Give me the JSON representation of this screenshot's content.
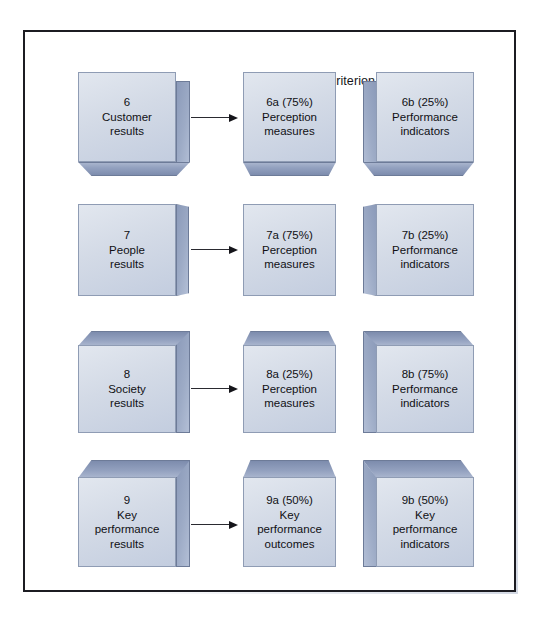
{
  "diagram": {
    "headers": {
      "left": "Criterion",
      "right": "Criterion parts"
    },
    "rows": [
      {
        "criterion": {
          "number": "6",
          "label": "6\nCustomer\nresults"
        },
        "parts": [
          {
            "code": "6a",
            "weight": "75%",
            "label": "6a (75%)\nPerception\nmeasures"
          },
          {
            "code": "6b",
            "weight": "25%",
            "label": "6b (25%)\nPerformance\nindicators"
          }
        ]
      },
      {
        "criterion": {
          "number": "7",
          "label": "7\nPeople\nresults"
        },
        "parts": [
          {
            "code": "7a",
            "weight": "75%",
            "label": "7a (75%)\nPerception\nmeasures"
          },
          {
            "code": "7b",
            "weight": "25%",
            "label": "7b (25%)\nPerformance\nindicators"
          }
        ]
      },
      {
        "criterion": {
          "number": "8",
          "label": "8\nSociety\nresults"
        },
        "parts": [
          {
            "code": "8a",
            "weight": "25%",
            "label": "8a (25%)\nPerception\nmeasures"
          },
          {
            "code": "8b",
            "weight": "75%",
            "label": "8b (75%)\nPerformance\nindicators"
          }
        ]
      },
      {
        "criterion": {
          "number": "9",
          "label": "9\nKey\nperformance\nresults"
        },
        "parts": [
          {
            "code": "9a",
            "weight": "50%",
            "label": "9a (50%)\nKey\nperformance\noutcomes"
          },
          {
            "code": "9b",
            "weight": "50%",
            "label": "9b (50%)\nKey\nperformance\nindicators"
          }
        ]
      }
    ],
    "colors": {
      "box_face": "#d3dae6",
      "box_shade": "#8b9ab9",
      "box_top": "#7d8cad",
      "border": "#1c1c22",
      "text": "#101014"
    }
  }
}
